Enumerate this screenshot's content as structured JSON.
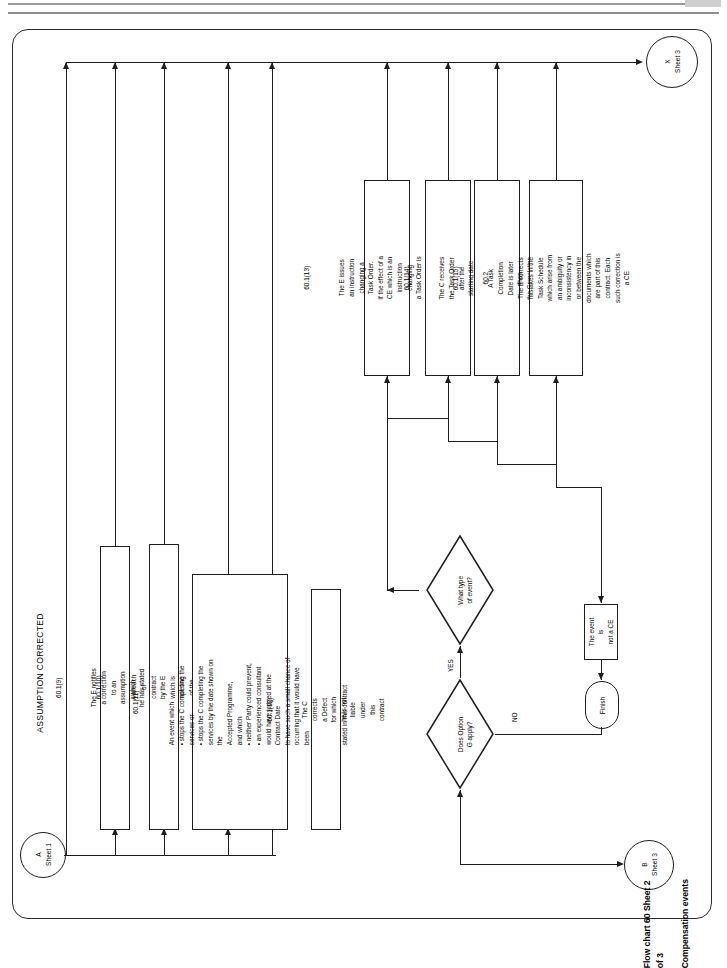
{
  "document": {
    "title_line1": "Flow chart 60 Sheet 2 of 3",
    "title_line2": "Compensation events"
  },
  "connectors": {
    "a_in": {
      "id": "A",
      "sheet": "Sheet 1"
    },
    "b_in": {
      "id": "B",
      "sheet": "Sheet 3"
    },
    "x_out": {
      "id": "X",
      "sheet": "Sheet 3"
    }
  },
  "section_headers": {
    "assumption_corrected": "ASSUMPTION CORRECTED",
    "breach_of_contract": "BREACH OF CONTRACT",
    "prevention": "PREVENTION",
    "consultant_corrects": "CONSULTANT CORRECTS OTHERS' DEFECT"
  },
  "boxes": {
    "clause_60_1_9": {
      "ref": "60.1(9)",
      "text": "The E notifies a correction to an assumption which\nhe has stated about a compensation event"
    },
    "clause_60_1_10": {
      "ref": "60.1(10)",
      "text": "A breach of contract by the E which is not one of the\nother CE's in this contract"
    },
    "clause_60_1_11": {
      "ref": "60.1(11)",
      "text": "An event which\n• stops the C completing the services or\n• stops the C completing the services by the date shown on the\n   Accepted Programme,\nand which\n• neither Party could prevent,\n• an experienced consultant would have judged at the Contract Date\n   to have such a small chance of occurring that it would have been\n   unreasonable for him to have allowed for it and\n• is not one of the other CE's stated in this contract"
    },
    "clause_60_1_12": {
      "ref": "60.1(12)",
      "text": "The C corrects a Defect for which he is not liable under this contract"
    },
    "clause_60_1_13": {
      "ref": "60.1(13)",
      "text": "The E issues an instruction changing a Task Order.\nIf the effect of a CE which is an instruction changing\na Task Order is to reduce the total Time Charge,\nthe Prices are reduced"
    },
    "clause_60_1_14": {
      "ref": "60.1(14)",
      "text": "The C receives the Task Order after the\nstarting date stated in the Task Order"
    },
    "clause_60_1_15": {
      "ref": "60.1(15)",
      "text": "A Task Completion Date is later than\nthe Completion Date"
    },
    "clause_60_2": {
      "ref": "60.2",
      "text": "The E corrects mistakes in the Task Schedule\nwhich arise from an ambiguity or inconsistency in\nor between the documents which are part of this\ncontract. Each such correction is a CE"
    },
    "not_a_ce": {
      "text": "The event is\nnot a CE"
    }
  },
  "decisions": {
    "option_g": {
      "text": "Does Option\nG apply?",
      "yes_label": "YES",
      "no_label": "NO"
    },
    "event_type": {
      "text": "What type\nof event?"
    }
  },
  "terminals": {
    "finish": "Finish"
  },
  "colors": {
    "stroke": "#1e1e1e",
    "background": "#ffffff",
    "page_rule": "#9a9a9a"
  }
}
